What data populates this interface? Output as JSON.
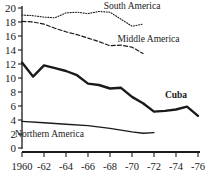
{
  "chart_data": {
    "type": "line",
    "title": "",
    "subtitle": "",
    "xlabel": "",
    "ylabel": "",
    "xlim": [
      1960,
      1976
    ],
    "ylim": [
      0,
      20
    ],
    "grid": false,
    "legend_position": "inline-annotations",
    "x_tick_labels": [
      "1960",
      "-62",
      "-64",
      "-66",
      "-68",
      "-70",
      "-72",
      "-74",
      "-76"
    ],
    "x_tick_values": [
      1960,
      1962,
      1964,
      1966,
      1968,
      1970,
      1972,
      1974,
      1976
    ],
    "y_tick_labels": [
      "0",
      "2",
      "4",
      "6",
      "8",
      "10",
      "12",
      "14",
      "16",
      "18",
      "20"
    ],
    "y_tick_values": [
      0,
      2,
      4,
      6,
      8,
      10,
      12,
      14,
      16,
      18,
      20
    ],
    "series": [
      {
        "name": "South America",
        "style": "dotted",
        "label": "South America",
        "x": [
          1960,
          1961,
          1962,
          1963,
          1964,
          1965,
          1966,
          1967,
          1968,
          1969,
          1970,
          1971
        ],
        "values": [
          19.0,
          18.9,
          18.7,
          18.6,
          19.3,
          19.4,
          19.2,
          19.5,
          19.4,
          18.4,
          17.4,
          17.7
        ]
      },
      {
        "name": "Middle America",
        "style": "dashed",
        "label": "Middle America",
        "x": [
          1960,
          1961,
          1962,
          1963,
          1964,
          1965,
          1966,
          1967,
          1968,
          1969,
          1970,
          1971
        ],
        "values": [
          18.1,
          18.0,
          17.7,
          17.1,
          16.6,
          16.2,
          15.7,
          15.2,
          14.6,
          14.7,
          14.4,
          13.5
        ]
      },
      {
        "name": "Cuba",
        "style": "solid-bold",
        "label": "Cuba",
        "x": [
          1960,
          1961,
          1962,
          1963,
          1964,
          1965,
          1966,
          1967,
          1968,
          1969,
          1970,
          1971,
          1972,
          1973,
          1974,
          1975,
          1976
        ],
        "values": [
          12.2,
          10.2,
          11.8,
          11.4,
          11.0,
          10.4,
          9.2,
          9.0,
          8.5,
          8.6,
          7.3,
          6.4,
          5.2,
          5.3,
          5.5,
          5.9,
          4.6
        ]
      },
      {
        "name": "Northern America",
        "style": "solid",
        "label": "Northern America",
        "x": [
          1960,
          1962,
          1964,
          1966,
          1968,
          1970,
          1971,
          1972
        ],
        "values": [
          3.8,
          3.6,
          3.4,
          3.2,
          2.8,
          2.3,
          2.1,
          2.2
        ]
      }
    ],
    "annotations": [
      {
        "text": "South America",
        "x": 1970,
        "y": 19.9
      },
      {
        "text": "Middle America",
        "x": 1971.5,
        "y": 15.2
      },
      {
        "text": "Cuba",
        "x": 1974,
        "y": 7.2
      },
      {
        "text": "Northern America",
        "x": 1962.5,
        "y": 1.6
      }
    ],
    "colors": {
      "ink": "#1a1a1a",
      "background": "#ffffff"
    }
  }
}
